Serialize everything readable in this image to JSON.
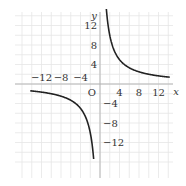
{
  "chart_data": {
    "type": "line",
    "title": "",
    "function": "y = 20/x",
    "xlabel": "x",
    "ylabel": "y",
    "origin_label": "O",
    "xlim": [
      -16,
      16
    ],
    "ylim": [
      -16,
      16
    ],
    "grid": true,
    "grid_step": 2,
    "x_ticks": [
      -12,
      -8,
      -4,
      4,
      8,
      12
    ],
    "x_tick_labels": [
      "−12",
      "−8",
      "−4",
      "4",
      "8",
      "12"
    ],
    "y_ticks": [
      12,
      8,
      4,
      -4,
      -8,
      -12
    ],
    "y_tick_labels": [
      "12",
      "8",
      "4",
      "−4",
      "−8",
      "−12"
    ],
    "series": [
      {
        "name": "branch-positive",
        "k": 20,
        "x_range": [
          1.3,
          14.3
        ]
      },
      {
        "name": "branch-negative",
        "k": 20,
        "x_range": [
          -14.3,
          -1.3
        ]
      }
    ],
    "colors": {
      "curve": "#222222",
      "axis": "#b0b0b0",
      "grid": "#e6e6e6"
    }
  }
}
